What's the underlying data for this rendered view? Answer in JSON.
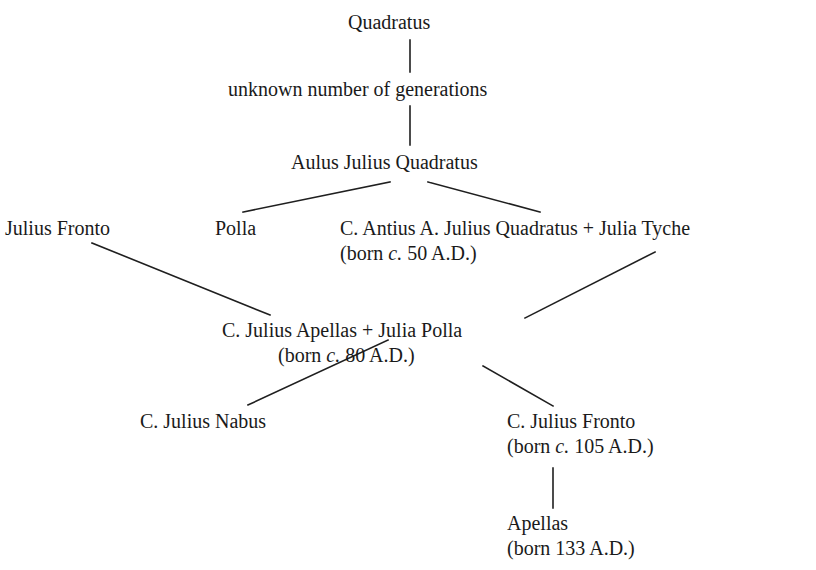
{
  "figure": {
    "type": "genealogy-tree",
    "background_color": "#ffffff",
    "text_color": "#1a1a1a",
    "line_color": "#1f1f1f"
  },
  "nodes": {
    "quadratus": {
      "name": "Quadratus"
    },
    "gap_note": {
      "name": "unknown number of generations"
    },
    "aulus": {
      "name": "Aulus Julius Quadratus"
    },
    "julius_fronto": {
      "name": "Julius Fronto"
    },
    "polla": {
      "name": "Polla"
    },
    "antius_couple": {
      "name": "C. Antius A. Julius Quadratus + Julia Tyche",
      "sub_open": "(born ",
      "sub_cite": "c.",
      "sub_close": " 50 A.D.)"
    },
    "apellas_couple": {
      "name": "C. Julius Apellas + Julia Polla",
      "sub_open": "(born ",
      "sub_cite": "c.",
      "sub_close": " 80 A.D.)"
    },
    "nabus": {
      "name": "C. Julius Nabus"
    },
    "fronto_jr": {
      "name": "C. Julius Fronto",
      "sub_open": "(born ",
      "sub_cite": "c.",
      "sub_close": " 105 A.D.)"
    },
    "apellas": {
      "name": "Apellas",
      "sub_open": "(born 133 A.D.)",
      "sub_cite": "",
      "sub_close": ""
    }
  },
  "edges": [
    {
      "from": "quadratus",
      "to": "gap_note",
      "kind": "vertical",
      "x1": 410,
      "y1": 40,
      "x2": 410,
      "y2": 72
    },
    {
      "from": "gap_note",
      "to": "aulus",
      "kind": "vertical",
      "x1": 410,
      "y1": 106,
      "x2": 410,
      "y2": 145
    },
    {
      "from": "aulus",
      "to": "polla",
      "kind": "diagonal",
      "x1": 390,
      "y1": 182,
      "x2": 243,
      "y2": 212
    },
    {
      "from": "aulus",
      "to": "antius_couple",
      "kind": "diagonal",
      "x1": 428,
      "y1": 182,
      "x2": 540,
      "y2": 212
    },
    {
      "from": "julius_fronto",
      "to": "apellas_couple",
      "kind": "diagonal",
      "x1": 92,
      "y1": 243,
      "x2": 270,
      "y2": 315
    },
    {
      "from": "antius_couple",
      "to": "apellas_couple",
      "kind": "diagonal",
      "x1": 655,
      "y1": 252,
      "x2": 525,
      "y2": 318
    },
    {
      "from": "apellas_couple",
      "to": "nabus",
      "kind": "diagonal",
      "x1": 388,
      "y1": 340,
      "x2": 248,
      "y2": 405
    },
    {
      "from": "apellas_couple",
      "to": "fronto_jr",
      "kind": "diagonal",
      "x1": 483,
      "y1": 366,
      "x2": 553,
      "y2": 406
    },
    {
      "from": "fronto_jr",
      "to": "apellas",
      "kind": "vertical",
      "x1": 553,
      "y1": 468,
      "x2": 553,
      "y2": 508
    }
  ]
}
